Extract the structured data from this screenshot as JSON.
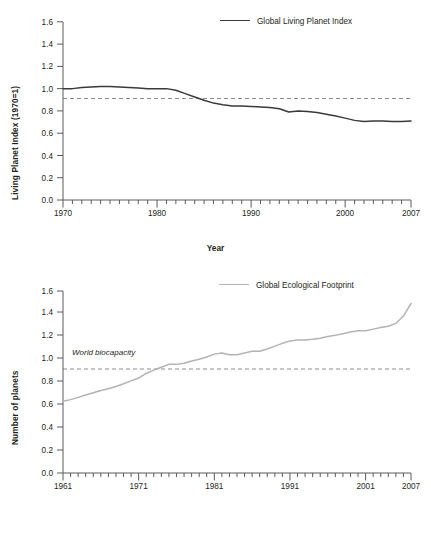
{
  "figure": {
    "background": "#ffffff",
    "text_color": "#231f20"
  },
  "top_chart": {
    "ylabel": "Living Planet Index (1970=1)",
    "xlabel": "Year",
    "legend_label": "Global Living Planet Index",
    "series_color": "#3a3a3a",
    "refline_color": "#6e6e6e",
    "ytick_labels": [
      "0.0",
      "0.2",
      "0.4",
      "0.6",
      "0.8",
      "1.0",
      "1.2",
      "1.4",
      "1.6"
    ],
    "xtick_labels": [
      "1970",
      "1980",
      "1990",
      "2000",
      "2007"
    ]
  },
  "bottom_chart": {
    "ylabel": "Number of planets",
    "xlabel": "Year",
    "legend_label": "Global Ecological Footprint",
    "annotation": "World biocapacity",
    "series_color": "#b3b3b3",
    "refline_color": "#6e6e6e",
    "ytick_labels": [
      "0.0",
      "0.2",
      "0.4",
      "0.6",
      "0.8",
      "1.0",
      "1.2",
      "1.4",
      "1.6"
    ],
    "xtick_labels": [
      "1961",
      "1971",
      "1981",
      "1991",
      "2001",
      "2007"
    ]
  },
  "chart_data": [
    {
      "type": "line",
      "title": "",
      "xlabel": "Year",
      "ylabel": "Living Planet Index (1970=1)",
      "xlim": [
        1970,
        2007
      ],
      "ylim": [
        0.0,
        1.6
      ],
      "grid": false,
      "legend_position": "top-right",
      "reference_line": {
        "y": 1.0,
        "style": "dashed",
        "label": ""
      },
      "series": [
        {
          "name": "Global Living Planet Index",
          "color": "#3a3a3a",
          "x": [
            1970,
            1971,
            1972,
            1973,
            1974,
            1975,
            1976,
            1977,
            1978,
            1979,
            1980,
            1981,
            1982,
            1983,
            1984,
            1985,
            1986,
            1987,
            1988,
            1989,
            1990,
            1991,
            1992,
            1993,
            1994,
            1995,
            1996,
            1997,
            1998,
            1999,
            2000,
            2001,
            2002,
            2003,
            2004,
            2005,
            2006,
            2007
          ],
          "values": [
            1.0,
            1.0,
            1.01,
            1.015,
            1.02,
            1.02,
            1.015,
            1.01,
            1.005,
            1.0,
            1.0,
            1.0,
            0.985,
            0.955,
            0.925,
            0.895,
            0.87,
            0.855,
            0.845,
            0.845,
            0.84,
            0.835,
            0.83,
            0.82,
            0.79,
            0.8,
            0.795,
            0.785,
            0.77,
            0.755,
            0.735,
            0.715,
            0.705,
            0.71,
            0.71,
            0.705,
            0.705,
            0.71
          ]
        }
      ]
    },
    {
      "type": "line",
      "title": "",
      "xlabel": "Year",
      "ylabel": "Number of planets",
      "xlim": [
        1961,
        2007
      ],
      "ylim": [
        0.0,
        1.6
      ],
      "grid": false,
      "legend_position": "top-right",
      "reference_line": {
        "y": 1.0,
        "style": "dashed",
        "label": "World biocapacity"
      },
      "series": [
        {
          "name": "Global Ecological Footprint",
          "color": "#b3b3b3",
          "x": [
            1961,
            1962,
            1963,
            1964,
            1965,
            1966,
            1967,
            1968,
            1969,
            1970,
            1971,
            1972,
            1973,
            1974,
            1975,
            1976,
            1977,
            1978,
            1979,
            1980,
            1981,
            1982,
            1983,
            1984,
            1985,
            1986,
            1987,
            1988,
            1989,
            1990,
            1991,
            1992,
            1993,
            1994,
            1995,
            1996,
            1997,
            1998,
            1999,
            2000,
            2001,
            2002,
            2003,
            2004,
            2005,
            2006,
            2007
          ],
          "values": [
            0.63,
            0.645,
            0.665,
            0.685,
            0.705,
            0.725,
            0.74,
            0.76,
            0.785,
            0.81,
            0.835,
            0.875,
            0.905,
            0.93,
            0.955,
            0.955,
            0.965,
            0.985,
            1.0,
            1.02,
            1.045,
            1.055,
            1.04,
            1.04,
            1.055,
            1.07,
            1.07,
            1.09,
            1.115,
            1.14,
            1.16,
            1.17,
            1.17,
            1.175,
            1.185,
            1.2,
            1.21,
            1.225,
            1.24,
            1.25,
            1.25,
            1.265,
            1.28,
            1.29,
            1.315,
            1.38,
            1.49
          ]
        }
      ]
    }
  ]
}
